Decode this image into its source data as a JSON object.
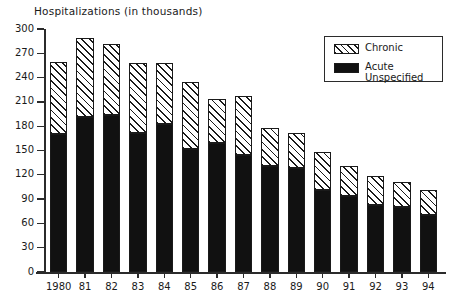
{
  "chart_data": {
    "type": "bar",
    "subtype": "stacked-vertical",
    "title": "Hospitalizations (in thousands)",
    "xlabel": "",
    "ylabel": "Hospitalizations (in thousands)",
    "ylim": [
      0,
      300
    ],
    "ytick_step": 30,
    "yticks": [
      300,
      270,
      240,
      210,
      180,
      150,
      120,
      90,
      60,
      30,
      0
    ],
    "ytick_labels": [
      "300",
      "270",
      "240",
      "210",
      "180",
      "150",
      "120",
      "90",
      "60",
      "30",
      "0"
    ],
    "categories": [
      "1980",
      "81",
      "82",
      "83",
      "84",
      "85",
      "86",
      "87",
      "88",
      "89",
      "90",
      "91",
      "92",
      "93",
      "94"
    ],
    "grid": false,
    "legend_position": "top-right",
    "series": [
      {
        "name": "Acute Unspecified",
        "fill": "solid",
        "color": "#111111",
        "values": [
          170,
          191,
          194,
          172,
          183,
          152,
          159,
          144,
          131,
          129,
          101,
          94,
          83,
          80,
          70
        ]
      },
      {
        "name": "Chronic",
        "fill": "hatched",
        "color": "#ffffff",
        "values": [
          89,
          98,
          88,
          86,
          75,
          82,
          54,
          73,
          47,
          43,
          47,
          37,
          36,
          31,
          31
        ]
      }
    ],
    "totals": [
      259,
      289,
      282,
      258,
      258,
      234,
      213,
      217,
      178,
      172,
      148,
      131,
      119,
      111,
      101
    ]
  },
  "legend": {
    "items": [
      {
        "label": "Chronic",
        "swatch": "hatched-swatch"
      },
      {
        "label": "Acute",
        "label2": "Unspecified",
        "swatch": "solid-black-swatch"
      }
    ]
  },
  "colors": {
    "acute": "#111111",
    "chronic_hatch": "#1a1a1a",
    "axis": "#2b2b2b",
    "background": "#ffffff"
  }
}
